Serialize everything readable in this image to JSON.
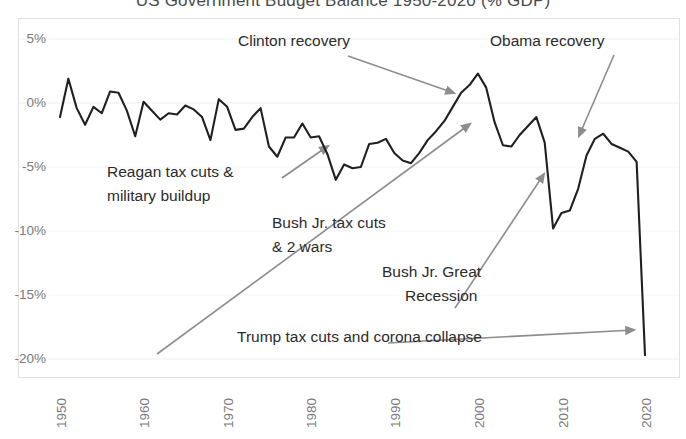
{
  "chart_data": {
    "type": "line",
    "title": "US Government Budget Balance 1950-2020 (% GDP)",
    "xlabel": "",
    "ylabel": "",
    "xlim": [
      1950,
      2020
    ],
    "ylim": [
      -20,
      5
    ],
    "grid": true,
    "legend": "none",
    "y_ticks": [
      "5%",
      "0%",
      "-5%",
      "-10%",
      "-15%",
      "-20%"
    ],
    "y_tick_values": [
      5,
      0,
      -5,
      -10,
      -15,
      -20
    ],
    "x_ticks": [
      "1950",
      "1960",
      "1970",
      "1980",
      "1990",
      "2000",
      "2010",
      "2020"
    ],
    "x_tick_values": [
      1950,
      1960,
      1970,
      1980,
      1990,
      2000,
      2010,
      2020
    ],
    "series": [
      {
        "name": "Budget balance (% GDP)",
        "color": "#231f20",
        "x": [
          1950,
          1951,
          1952,
          1953,
          1954,
          1955,
          1956,
          1957,
          1958,
          1959,
          1960,
          1961,
          1962,
          1963,
          1964,
          1965,
          1966,
          1967,
          1968,
          1969,
          1970,
          1971,
          1972,
          1973,
          1974,
          1975,
          1976,
          1977,
          1978,
          1979,
          1980,
          1981,
          1982,
          1983,
          1984,
          1985,
          1986,
          1987,
          1988,
          1989,
          1990,
          1991,
          1992,
          1993,
          1994,
          1995,
          1996,
          1997,
          1998,
          1999,
          2000,
          2001,
          2002,
          2003,
          2004,
          2005,
          2006,
          2007,
          2008,
          2009,
          2010,
          2011,
          2012,
          2013,
          2014,
          2015,
          2016,
          2017,
          2018,
          2019,
          2020
        ],
        "values": [
          -1.1,
          1.9,
          -0.4,
          -1.7,
          -0.3,
          -0.8,
          0.9,
          0.8,
          -0.6,
          -2.6,
          0.1,
          -0.6,
          -1.3,
          -0.8,
          -0.9,
          -0.2,
          -0.5,
          -1.1,
          -2.9,
          0.3,
          -0.3,
          -2.1,
          -2.0,
          -1.1,
          -0.4,
          -3.4,
          -4.2,
          -2.7,
          -2.7,
          -1.6,
          -2.7,
          -2.6,
          -4.0,
          -6.0,
          -4.8,
          -5.1,
          -5.0,
          -3.2,
          -3.1,
          -2.8,
          -3.9,
          -4.5,
          -4.7,
          -3.9,
          -2.9,
          -2.2,
          -1.4,
          -0.3,
          0.8,
          1.4,
          2.3,
          1.2,
          -1.5,
          -3.3,
          -3.4,
          -2.5,
          -1.8,
          -1.1,
          -3.1,
          -9.8,
          -8.6,
          -8.4,
          -6.7,
          -4.1,
          -2.8,
          -2.4,
          -3.2,
          -3.5,
          -3.8,
          -4.6,
          -19.7
        ]
      }
    ],
    "annotations": [
      {
        "label": "Clinton recovery",
        "x": 238,
        "y": 31,
        "arrow_from": [
          348,
          56
        ],
        "arrow_to": [
          456,
          94
        ]
      },
      {
        "label": "Obama recovery",
        "x": 490,
        "y": 31,
        "arrow_from": [
          614,
          55
        ],
        "arrow_to": [
          578,
          138
        ]
      },
      {
        "label": "Reagan tax cuts &",
        "label2": "military buildup",
        "x": 107,
        "y": 162,
        "arrow_from": [
          282,
          178
        ],
        "arrow_to": [
          327,
          145
        ]
      },
      {
        "label": "Bush Jr. tax cuts",
        "label2": "& 2 wars",
        "x": 272,
        "y": 213,
        "arrow_from": [
          157,
          354
        ],
        "arrow_to": [
          472,
          122
        ]
      },
      {
        "label": "Bush Jr. Great",
        "label2": "Recession",
        "x": 382,
        "y": 262,
        "arrow_from": [
          455,
          308
        ],
        "arrow_to": [
          545,
          172
        ]
      },
      {
        "label": "Trump tax cuts and corona collapse",
        "x": 237,
        "y": 327,
        "arrow_from": [
          388,
          343
        ],
        "arrow_to": [
          635,
          331
        ]
      }
    ]
  },
  "axes": {
    "y_labels": [
      {
        "text": "5%",
        "top": 31
      },
      {
        "text": "0%",
        "top": 95
      },
      {
        "text": "-5%",
        "top": 159
      },
      {
        "text": "-10%",
        "top": 223
      },
      {
        "text": "-15%",
        "top": 287
      },
      {
        "text": "-20%",
        "top": 351
      }
    ],
    "x_labels": [
      {
        "text": "1950",
        "left": 60
      },
      {
        "text": "1960",
        "left": 143
      },
      {
        "text": "1970",
        "left": 227
      },
      {
        "text": "1980",
        "left": 310
      },
      {
        "text": "1990",
        "left": 394
      },
      {
        "text": "2000",
        "left": 478
      },
      {
        "text": "2010",
        "left": 562
      },
      {
        "text": "2020",
        "left": 645
      }
    ]
  }
}
